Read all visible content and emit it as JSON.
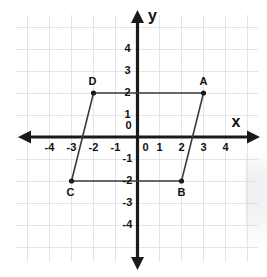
{
  "figure": {
    "axis_x_label": "x",
    "axis_y_label": "y",
    "origin_label": "0",
    "grid_color": "#e2e4e8",
    "axis_color": "#1a1a1a",
    "shape_color": "#3a3a3a"
  },
  "chart_data": {
    "type": "scatter",
    "xlabel": "x",
    "ylabel": "y",
    "xlim": [
      -5,
      5
    ],
    "ylim": [
      -5,
      5
    ],
    "grid": true,
    "legend": "none",
    "x_ticks": [
      -4,
      -3,
      -2,
      -1,
      0,
      1,
      2,
      3,
      4
    ],
    "y_ticks": [
      4,
      3,
      2,
      1,
      0,
      -1,
      -2,
      -3,
      -4
    ],
    "x_tick_labels": [
      "-4",
      "-3",
      "-2",
      "-1",
      "0",
      "1",
      "2",
      "3",
      "4"
    ],
    "y_tick_labels": [
      "4",
      "3",
      "2",
      "1",
      "0",
      "-1",
      "-2",
      "-3",
      "-4"
    ],
    "points": [
      {
        "label": "A",
        "x": 3,
        "y": 2,
        "label_dx": 0,
        "label_dy": -11
      },
      {
        "label": "B",
        "x": 2,
        "y": -2,
        "label_dx": 0,
        "label_dy": 12
      },
      {
        "label": "C",
        "x": -3,
        "y": -2,
        "label_dx": -1,
        "label_dy": 12
      },
      {
        "label": "D",
        "x": -2,
        "y": 2,
        "label_dx": -1,
        "label_dy": -11
      }
    ],
    "polygon": [
      "A",
      "B",
      "C",
      "D"
    ],
    "polygon_closed": true,
    "shape_name": "parallelogram"
  }
}
